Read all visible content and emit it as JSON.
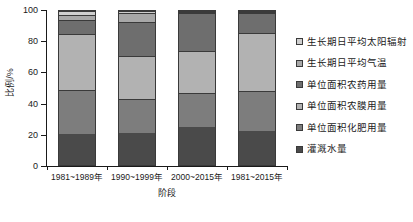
{
  "chart_data": {
    "type": "bar",
    "subtype": "stacked-100-percent",
    "title": "",
    "xlabel": "阶段",
    "ylabel": "比例/%",
    "ylim": [
      0,
      100
    ],
    "yticks": [
      0,
      20,
      40,
      60,
      80,
      100
    ],
    "ytick_labels": [
      "0",
      "20",
      "40",
      "60",
      "80",
      "100"
    ],
    "grid": false,
    "legend_position": "right",
    "categories": [
      "1981~1989年",
      "1990~1999年",
      "2000~2015年",
      "1981~2015年"
    ],
    "series": [
      {
        "name": "灌溉水量",
        "color": "#4a4a4a",
        "values": [
          20.0,
          21.0,
          25.0,
          22.0
        ]
      },
      {
        "name": "单位面积化肥用量",
        "color": "#7d7d7d",
        "values": [
          29.0,
          22.0,
          22.0,
          26.0
        ]
      },
      {
        "name": "单位面积农膜用量",
        "color": "#b2b2b2",
        "values": [
          36.0,
          28.0,
          27.0,
          38.0
        ]
      },
      {
        "name": "单位面积农药用量",
        "color": "#6e6e6e",
        "values": [
          9.0,
          22.0,
          25.0,
          13.0
        ]
      },
      {
        "name": "生长期日平均气温",
        "color": "#a8a8a8",
        "values": [
          3.5,
          6.0,
          0.6,
          0.6
        ]
      },
      {
        "name": "生长期日平均太阳辐射",
        "color": "#cfcfcf",
        "values": [
          2.5,
          1.0,
          0.4,
          0.4
        ]
      }
    ],
    "legend_order_top_to_bottom": [
      "生长期日平均太阳辐射",
      "生长期日平均气温",
      "单位面积农药用量",
      "单位面积农膜用量",
      "单位面积化肥用量",
      "灌溉水量"
    ]
  }
}
